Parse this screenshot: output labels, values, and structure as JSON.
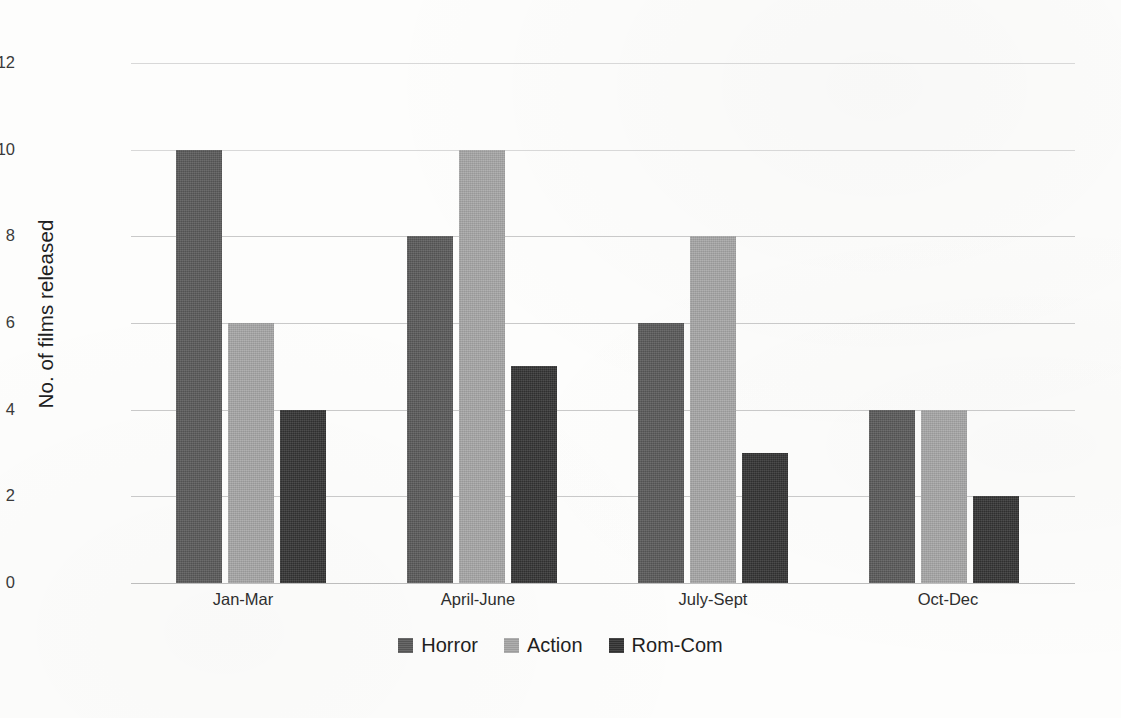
{
  "chart_data": {
    "type": "bar",
    "title": "",
    "subtitle": "",
    "xlabel": "",
    "ylabel": "No. of films released",
    "categories": [
      "Jan-Mar",
      "April-June",
      "July-Sept",
      "Oct-Dec"
    ],
    "series": [
      {
        "name": "Horror",
        "color": "#595959",
        "values": [
          10,
          6,
          6,
          4
        ]
      },
      {
        "name": "Action",
        "color": "#a6a6a6",
        "values": [
          6,
          10,
          8,
          4
        ]
      },
      {
        "name": "Rom-Com",
        "color": "#333333",
        "values": [
          4,
          5,
          3,
          2
        ]
      }
    ],
    "ylim": [
      0,
      12
    ],
    "yticks": [
      0,
      2,
      4,
      6,
      8,
      10,
      12
    ],
    "ytick_labels": [
      "0",
      "2",
      "4",
      "6",
      "8",
      "10",
      "12"
    ],
    "grid": true,
    "grid_axis": "y",
    "legend_position": "bottom-center",
    "orientation": "vertical",
    "grouping": "grouped"
  },
  "chart_values_corrected": {
    "Horror": [
      10,
      8,
      6,
      4
    ],
    "Action": [
      6,
      10,
      8,
      4
    ],
    "Rom-Com": [
      4,
      5,
      3,
      2
    ]
  },
  "axis": {
    "y_title": "No. of films released"
  },
  "legend": {
    "items": [
      {
        "label": "Horror"
      },
      {
        "label": "Action"
      },
      {
        "label": "Rom-Com"
      }
    ]
  },
  "colors": {
    "horror": "#595959",
    "action": "#a6a6a6",
    "romcom": "#333333",
    "gridline": "#c9c9c9",
    "text": "#1f1f1f",
    "background": "#fdfdfc"
  }
}
